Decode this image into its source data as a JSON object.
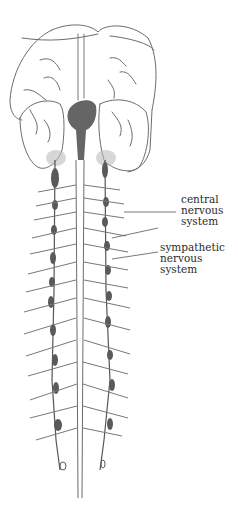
{
  "figure": {
    "colors": {
      "stroke": "#6b6b6b",
      "dark_fill": "#4a4a4a",
      "ganglion": "#5a5a5a",
      "background": "#ffffff",
      "label_text": "#2a2a2a"
    }
  },
  "labels": {
    "central": {
      "lines": [
        "central",
        "nervous",
        "system"
      ]
    },
    "sympathetic": {
      "lines": [
        "sympathetic",
        "nervous",
        "system"
      ]
    }
  }
}
